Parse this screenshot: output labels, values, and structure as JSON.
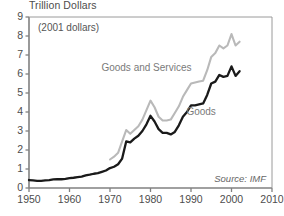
{
  "chart_data": {
    "type": "line",
    "title": "Trillion Dollars",
    "subtitle": "(2001 dollars)",
    "source": "Source: IMF",
    "xlabel": "",
    "ylabel": "Trillion Dollars",
    "xlim": [
      1950,
      2010
    ],
    "ylim": [
      0,
      9
    ],
    "xticks": [
      1950,
      1960,
      1970,
      1980,
      1990,
      2000,
      2010
    ],
    "yticks": [
      0,
      1,
      2,
      3,
      4,
      5,
      6,
      7,
      8,
      9
    ],
    "grid": false,
    "legend_position": "inline-annotation",
    "colors": {
      "goods": "#1a1a1a",
      "goods_and_services": "#b9b9b9",
      "axis": "#808080",
      "text": "#4d4d4d"
    },
    "series": [
      {
        "name": "Goods and Services",
        "color": "#b9b9b9",
        "label_x": 1979.0,
        "label_y": 6.15,
        "x": [
          1970,
          1971,
          1972,
          1973,
          1974,
          1975,
          1976,
          1977,
          1978,
          1979,
          1980,
          1981,
          1982,
          1983,
          1984,
          1985,
          1986,
          1987,
          1988,
          1989,
          1990,
          1991,
          1992,
          1993,
          1994,
          1995,
          1996,
          1997,
          1998,
          1999,
          2000,
          2001,
          2002
        ],
        "values": [
          1.5,
          1.65,
          1.85,
          2.45,
          3.05,
          2.85,
          3.05,
          3.25,
          3.6,
          4.1,
          4.6,
          4.25,
          3.75,
          3.55,
          3.55,
          3.6,
          3.95,
          4.3,
          4.8,
          5.15,
          5.5,
          5.55,
          5.6,
          5.65,
          6.2,
          6.9,
          7.1,
          7.5,
          7.35,
          7.5,
          8.1,
          7.5,
          7.7
        ]
      },
      {
        "name": "Goods",
        "color": "#1a1a1a",
        "label_x": 1992.5,
        "label_y": 3.85,
        "x": [
          1950,
          1951,
          1952,
          1953,
          1954,
          1955,
          1956,
          1957,
          1958,
          1959,
          1960,
          1961,
          1962,
          1963,
          1964,
          1965,
          1966,
          1967,
          1968,
          1969,
          1970,
          1971,
          1972,
          1973,
          1974,
          1975,
          1976,
          1977,
          1978,
          1979,
          1980,
          1981,
          1982,
          1983,
          1984,
          1985,
          1986,
          1987,
          1988,
          1989,
          1990,
          1991,
          1992,
          1993,
          1994,
          1995,
          1996,
          1997,
          1998,
          1999,
          2000,
          2001,
          2002
        ],
        "values": [
          0.42,
          0.4,
          0.38,
          0.38,
          0.4,
          0.42,
          0.45,
          0.47,
          0.46,
          0.48,
          0.52,
          0.54,
          0.57,
          0.6,
          0.66,
          0.7,
          0.75,
          0.78,
          0.85,
          0.92,
          1.05,
          1.12,
          1.25,
          1.55,
          2.45,
          2.4,
          2.6,
          2.75,
          3.0,
          3.35,
          3.8,
          3.5,
          3.1,
          2.9,
          2.9,
          2.82,
          2.95,
          3.3,
          3.75,
          4.0,
          4.35,
          4.35,
          4.4,
          4.45,
          4.9,
          5.5,
          5.6,
          5.95,
          5.85,
          5.9,
          6.4,
          5.9,
          6.15
        ]
      }
    ]
  }
}
